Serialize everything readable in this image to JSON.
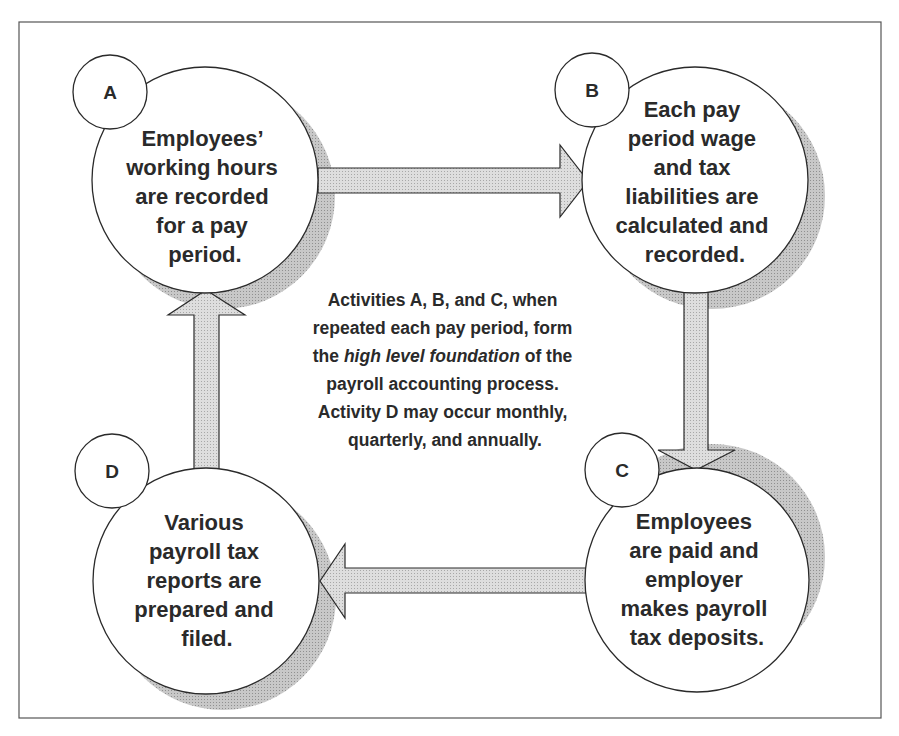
{
  "diagram": {
    "type": "cycle",
    "colors": {
      "stroke": "#2a2a2a",
      "arrow_fill": "#d4d4d4",
      "shadow": "#bdbdbd",
      "frame": "#555555"
    },
    "nodes": [
      {
        "id": "A",
        "label": "A",
        "lines": [
          "Employees’",
          "working hours",
          "are recorded",
          "for a pay",
          "period."
        ]
      },
      {
        "id": "B",
        "label": "B",
        "lines": [
          "Each pay",
          "period wage",
          "and tax",
          "liabilities are",
          "calculated and",
          "recorded."
        ]
      },
      {
        "id": "C",
        "label": "C",
        "lines": [
          "Employees",
          "are paid and",
          "employer",
          "makes payroll",
          "tax deposits."
        ]
      },
      {
        "id": "D",
        "label": "D",
        "lines": [
          "Various",
          "payroll tax",
          "reports are",
          "prepared and",
          "filed."
        ]
      }
    ],
    "edges": [
      {
        "from": "A",
        "to": "B"
      },
      {
        "from": "B",
        "to": "C"
      },
      {
        "from": "C",
        "to": "D"
      },
      {
        "from": "D",
        "to": "A"
      }
    ],
    "center_note": {
      "line1": "Activities A, B, and C, when",
      "line2": "repeated each pay period, form",
      "line3_pre": "the ",
      "line3_italic": "high level foundation",
      "line3_post": " of the",
      "line4": "payroll accounting process.",
      "line5": "Activity D may occur monthly,",
      "line6": "quarterly, and annually."
    }
  }
}
